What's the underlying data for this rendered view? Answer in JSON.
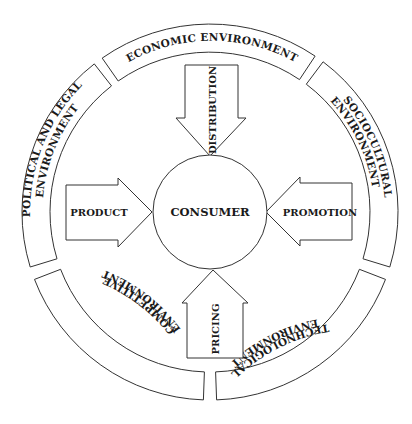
{
  "diagram": {
    "center": {
      "label": "CONSUMER"
    },
    "arrows": [
      {
        "id": "distribution",
        "label": "DISTRIBUTION",
        "direction": "down"
      },
      {
        "id": "product",
        "label": "PRODUCT",
        "direction": "right"
      },
      {
        "id": "promotion",
        "label": "PROMOTION",
        "direction": "left"
      },
      {
        "id": "pricing",
        "label": "PRICING",
        "direction": "up"
      }
    ],
    "environments": [
      {
        "id": "economic",
        "lines": [
          "ECONOMIC ENVIRONMENT"
        ]
      },
      {
        "id": "sociocultural",
        "lines": [
          "SOCIOCULTURAL",
          "ENVIRONMENT"
        ]
      },
      {
        "id": "technological",
        "lines": [
          "TECHNOLOGICAL",
          "ENVIRONMENT"
        ]
      },
      {
        "id": "competitive",
        "lines": [
          "COMPETITIVE",
          "ENVIRONMENT"
        ]
      },
      {
        "id": "political",
        "lines": [
          "POLITICAL AND LEGAL",
          "ENVIRONMENT"
        ]
      }
    ],
    "colors": {
      "stroke": "#333333",
      "text": "#1a1a1a",
      "background": "#ffffff"
    }
  }
}
